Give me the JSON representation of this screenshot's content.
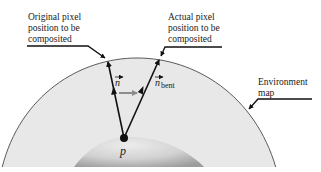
{
  "labels": {
    "original_line1": "Original pixel",
    "original_line2": "position to be",
    "original_line3": "composited",
    "actual_line1": "Actual pixel",
    "actual_line2": "position to be",
    "actual_line3": "composited",
    "env_line1": "Environment",
    "env_line2": "map",
    "normal": "n",
    "bent_normal": "n",
    "bent_subscript": "bent",
    "point": "p"
  },
  "colors": {
    "environment_fill": "#e6e6e6",
    "environment_stroke": "#555555",
    "sphere_light": "#e0e0e0",
    "sphere_dark": "#9a9a9a",
    "arrow": "#111111",
    "bend_arrow": "#8c8c8c",
    "background": "#ffffff"
  }
}
